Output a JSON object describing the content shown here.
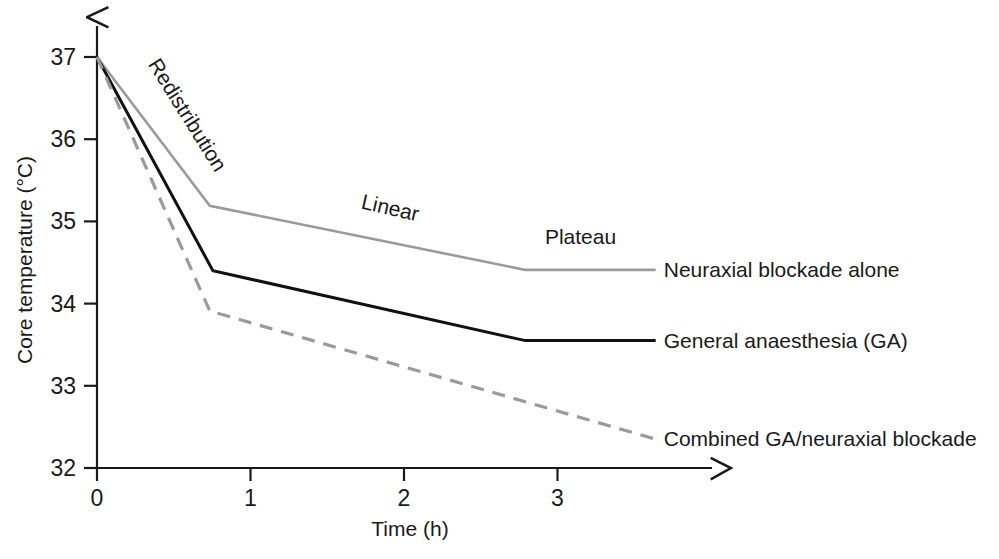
{
  "chart_data": {
    "type": "line",
    "title": "",
    "xlabel": "Time (h)",
    "ylabel": "Core temperature (°C)",
    "xlim": [
      0,
      4.1
    ],
    "ylim": [
      32,
      37.35
    ],
    "xticks": [
      0,
      1,
      2,
      3
    ],
    "xtick_labels": [
      "0",
      "1",
      "2",
      "3"
    ],
    "yticks": [
      32,
      33,
      34,
      35,
      36,
      37
    ],
    "ytick_labels": [
      "32",
      "33",
      "34",
      "35",
      "36",
      "37"
    ],
    "grid": false,
    "legend_position": "right-inline",
    "annotations": [
      {
        "text": "Redistribution",
        "x": 0.55,
        "y": 36.25,
        "rotation": 58
      },
      {
        "text": "Linear",
        "x": 1.9,
        "y": 35.08,
        "rotation": 13
      },
      {
        "text": "Plateau",
        "x": 3.15,
        "y": 34.72,
        "rotation": 0
      }
    ],
    "series": [
      {
        "name": "Neuraxial blockade alone",
        "label": "Neuraxial blockade alone",
        "style": "solid",
        "color": "#9a9a9a",
        "width": 2.6,
        "x": [
          0.0,
          0.735,
          2.79,
          3.64
        ],
        "y": [
          37.0,
          35.19,
          34.41,
          34.41
        ]
      },
      {
        "name": "General anaesthesia (GA)",
        "label": "General anaesthesia (GA)",
        "style": "solid",
        "color": "#111111",
        "width": 3.0,
        "x": [
          0.0,
          0.755,
          2.79,
          3.64
        ],
        "y": [
          37.0,
          34.4,
          33.55,
          33.55
        ]
      },
      {
        "name": "Combined GA/neuraxial blockade",
        "label": "Combined GA/neuraxial blockade",
        "style": "dashed",
        "color": "#9a9a9a",
        "width": 3.2,
        "x": [
          0.0,
          0.735,
          3.64
        ],
        "y": [
          37.0,
          33.91,
          32.35
        ]
      }
    ]
  },
  "axes": {
    "x_axis_name": "time-axis",
    "y_axis_name": "core-temperature-axis"
  },
  "colors": {
    "ink": "#1a1a1a",
    "grey_series": "#9a9a9a",
    "black_series": "#111111",
    "background": "#ffffff"
  }
}
